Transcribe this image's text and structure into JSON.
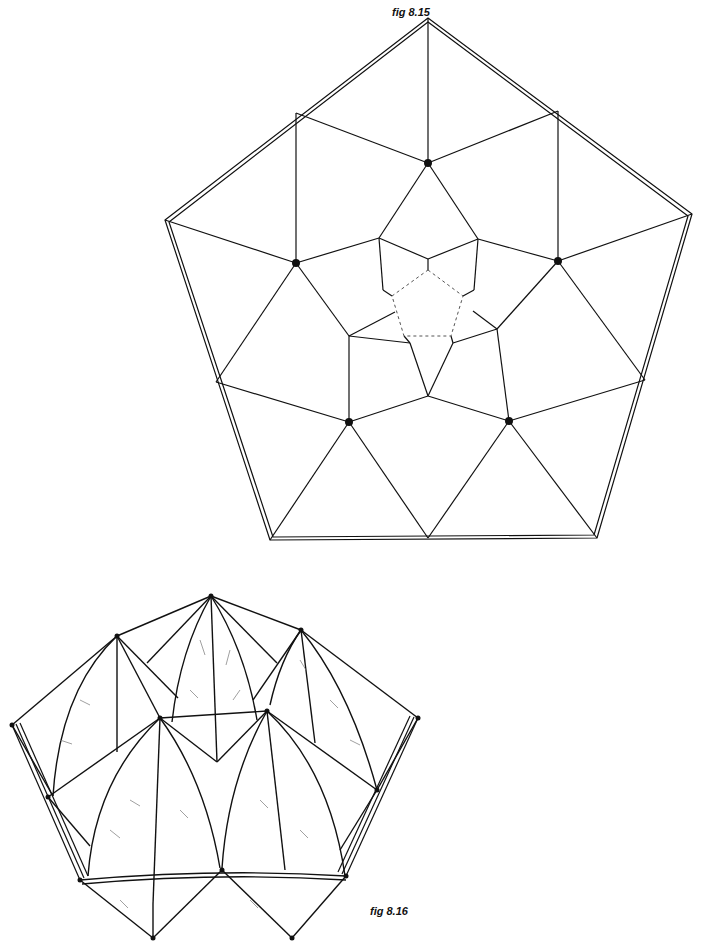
{
  "figures": [
    {
      "id": "fig-8-15",
      "caption": "fig 8.15",
      "description": "Plane net of a pentagon subdivided into kites and triangles around a dashed central pentagon; five black node dots",
      "outer_pentagon": [
        [
          428,
          18
        ],
        [
          692,
          214
        ],
        [
          597,
          538
        ],
        [
          270,
          540
        ],
        [
          165,
          220
        ]
      ],
      "nodes": [
        [
          428,
          163
        ],
        [
          296,
          263
        ],
        [
          558,
          261
        ],
        [
          349,
          422
        ],
        [
          509,
          421
        ]
      ],
      "dashed_pentagon": [
        [
          428,
          270
        ],
        [
          463,
          296
        ],
        [
          451,
          336
        ],
        [
          404,
          336
        ],
        [
          392,
          296
        ]
      ]
    },
    {
      "id": "fig-8-16",
      "caption": "fig 8.16",
      "description": "Perspective drawing of the folded/assembled structure with curved ribs and hatched shading"
    }
  ],
  "colors": {
    "line": "#111111",
    "dashed": "#666666",
    "background": "#ffffff"
  }
}
